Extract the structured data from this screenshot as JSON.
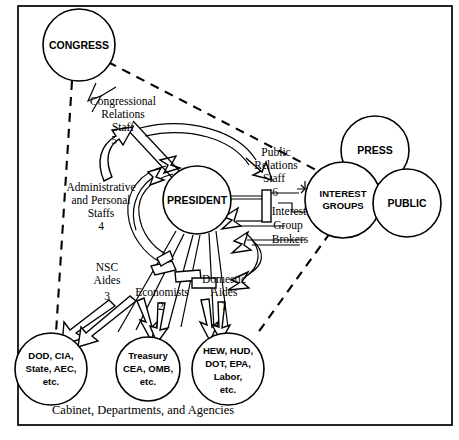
{
  "figure": {
    "caption": "Cabinet, Departments, and Agencies",
    "frame_color": "#000000",
    "background_color": "#ffffff"
  },
  "nodes": {
    "congress": {
      "label": "CONGRESS"
    },
    "president": {
      "label": "PRESIDENT"
    },
    "press": {
      "label": "PRESS"
    },
    "interest_groups": {
      "label_line1": "INTEREST",
      "label_line2": "GROUPS"
    },
    "public": {
      "label": "PUBLIC"
    },
    "defense": {
      "line1": "DOD, CIA,",
      "line2": "State, AEC,",
      "line3": "etc."
    },
    "economic": {
      "line1": "Treasury",
      "line2": "CEA, OMB,",
      "line3": "etc."
    },
    "domestic": {
      "line1": "HEW, HUD,",
      "line2": "DOT, EPA,",
      "line3": "Labor,",
      "line4": "etc."
    }
  },
  "staff_labels": {
    "congressional_relations": {
      "line1": "Congressional",
      "line2": "Relations",
      "line3": "Staff",
      "number": "5"
    },
    "administrative_personal": {
      "line1": "Administrative",
      "line2": "and Personal",
      "line3": "Staffs",
      "number": "4"
    },
    "nsc_aides": {
      "line1": "NSC",
      "line2": "Aides",
      "number": "3"
    },
    "economists": {
      "line1": "Economists",
      "number": "2"
    },
    "domestic_aides": {
      "line1": "Domestic",
      "line2": "Aides",
      "number": "1"
    },
    "public_relations": {
      "line1": "Public",
      "line2": "Relations",
      "line3": "Staff",
      "number": "6"
    },
    "interest_group_brokers": {
      "line1": "Interest",
      "line2": "Group",
      "line3": "Brokers"
    }
  }
}
